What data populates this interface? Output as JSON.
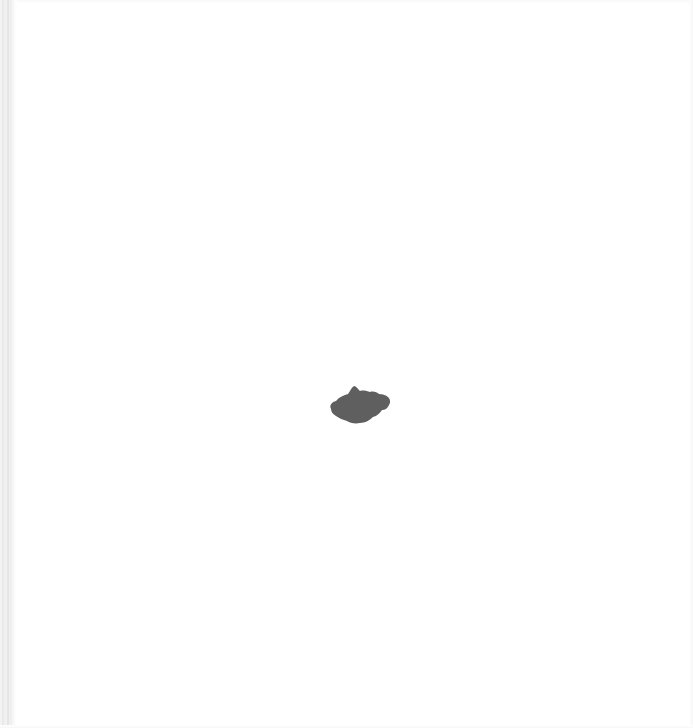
{
  "canvas": {
    "width": 693,
    "height": 728,
    "background_color": "#ffffff"
  },
  "left_edge": {
    "color": "#ececec"
  },
  "shape": {
    "type": "irregular-blob",
    "fill_color": "#5f5f5f",
    "center_x": 360,
    "center_y": 405
  }
}
